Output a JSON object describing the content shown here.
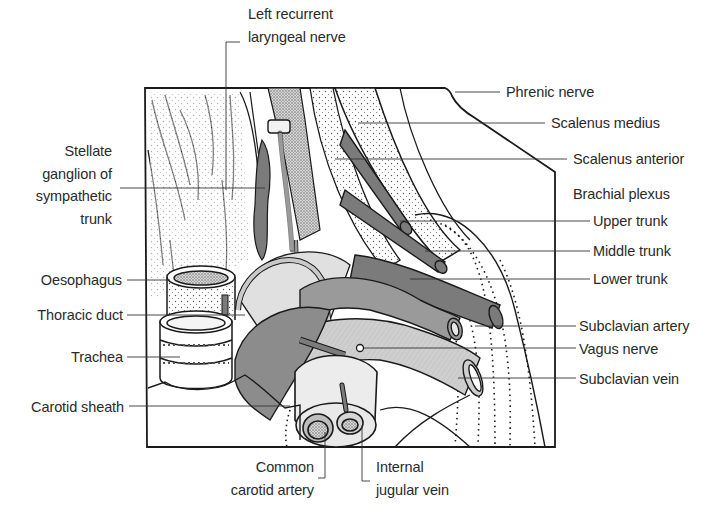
{
  "figure": {
    "colors": {
      "background": "#ffffff",
      "outline": "#1a1a1a",
      "label_text": "#2a2a2a",
      "leader_line": "#333333",
      "dark_grey_structures": "#7b7b7b",
      "mid_grey_structures": "#9a9a9a",
      "light_grey_structures": "#c9c9c9",
      "pale_fill": "#e6e6e6"
    }
  },
  "labels": {
    "top": {
      "left_recurrent_laryngeal_nerve": {
        "line1": "Left recurrent",
        "line2": "laryngeal nerve"
      }
    },
    "left": {
      "stellate_ganglion": {
        "line1": "Stellate",
        "line2": "ganglion of",
        "line3": "sympathetic",
        "line4": "trunk"
      },
      "oesophagus": "Oesophagus",
      "thoracic_duct": "Thoracic duct",
      "trachea": "Trachea",
      "carotid_sheath": "Carotid sheath"
    },
    "right": {
      "phrenic_nerve": "Phrenic nerve",
      "scalenus_medius": "Scalenus medius",
      "scalenus_anterior": "Scalenus anterior",
      "brachial_plexus": "Brachial plexus",
      "upper_trunk": "Upper trunk",
      "middle_trunk": "Middle trunk",
      "lower_trunk": "Lower trunk",
      "subclavian_artery": "Subclavian artery",
      "vagus_nerve": "Vagus nerve",
      "subclavian_vein": "Subclavian vein"
    },
    "bottom": {
      "common_carotid_artery": {
        "line1": "Common",
        "line2": "carotid artery"
      },
      "internal_jugular_vein": {
        "line1": "Internal",
        "line2": "jugular vein"
      }
    }
  }
}
